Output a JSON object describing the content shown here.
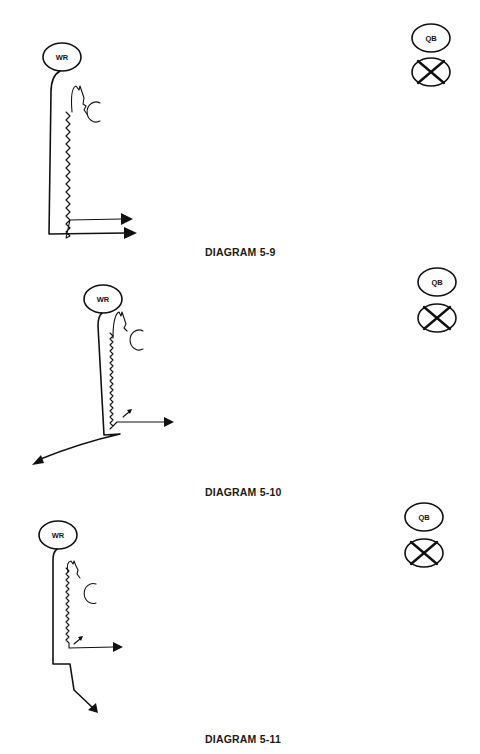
{
  "diagrams": [
    {
      "caption": "DIAGRAM 5-9",
      "receiver_label": "WR",
      "quarterback_label": "QB"
    },
    {
      "caption": "DIAGRAM 5-10",
      "receiver_label": "WR",
      "quarterback_label": "QB"
    },
    {
      "caption": "DIAGRAM 5-11",
      "receiver_label": "WR",
      "quarterback_label": "QB"
    }
  ],
  "colors": {
    "ink": "#111111",
    "background": "#ffffff"
  }
}
